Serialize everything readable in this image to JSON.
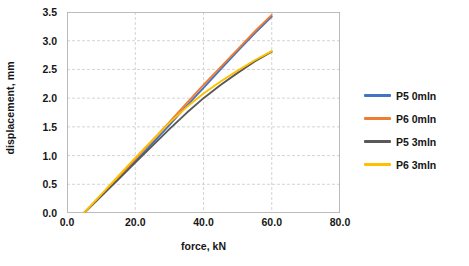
{
  "chart_data": {
    "type": "line",
    "title": "",
    "xlabel": "force, kN",
    "ylabel": "displacement, mm",
    "xlim": [
      0.0,
      80.0
    ],
    "ylim": [
      0.0,
      3.5
    ],
    "xticks": [
      "0.0",
      "20.0",
      "40.0",
      "60.0",
      "80.0"
    ],
    "yticks": [
      "0.0",
      "0.5",
      "1.0",
      "1.5",
      "2.0",
      "2.5",
      "3.0",
      "3.5"
    ],
    "xtick_values": [
      0.0,
      20.0,
      40.0,
      60.0,
      80.0
    ],
    "ytick_values": [
      0.0,
      0.5,
      1.0,
      1.5,
      2.0,
      2.5,
      3.0,
      3.5
    ],
    "grid": true,
    "grid_style": "dashed",
    "grid_color": "#c9c9c9",
    "legend_position": "right",
    "legend_border": false,
    "series": [
      {
        "name": "P5 0mln",
        "color": "#4472C4",
        "x": [
          5.0,
          10.0,
          15.0,
          20.0,
          25.0,
          30.0,
          35.0,
          40.0,
          45.0,
          50.0,
          55.0,
          60.0
        ],
        "values": [
          0.0,
          0.3,
          0.6,
          0.9,
          1.21,
          1.53,
          1.86,
          2.18,
          2.5,
          2.82,
          3.13,
          3.42
        ]
      },
      {
        "name": "P6 0mln",
        "color": "#ED7D31",
        "x": [
          5.0,
          10.0,
          15.0,
          20.0,
          25.0,
          30.0,
          35.0,
          40.0,
          45.0,
          50.0,
          55.0,
          60.0
        ],
        "values": [
          0.0,
          0.31,
          0.62,
          0.94,
          1.26,
          1.58,
          1.91,
          2.23,
          2.54,
          2.85,
          3.16,
          3.45
        ]
      },
      {
        "name": "P5 3mln",
        "color": "#595959",
        "x": [
          5.0,
          10.0,
          15.0,
          20.0,
          25.0,
          30.0,
          35.0,
          40.0,
          45.0,
          50.0,
          55.0,
          60.0
        ],
        "values": [
          0.0,
          0.29,
          0.58,
          0.88,
          1.17,
          1.46,
          1.74,
          2.0,
          2.23,
          2.44,
          2.64,
          2.81
        ]
      },
      {
        "name": "P6 3mln",
        "color": "#FFC000",
        "x": [
          5.0,
          10.0,
          15.0,
          20.0,
          25.0,
          30.0,
          35.0,
          40.0,
          45.0,
          50.0,
          55.0,
          60.0
        ],
        "values": [
          0.0,
          0.32,
          0.64,
          0.96,
          1.27,
          1.57,
          1.84,
          2.08,
          2.29,
          2.48,
          2.66,
          2.82
        ]
      }
    ]
  }
}
